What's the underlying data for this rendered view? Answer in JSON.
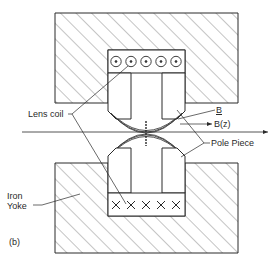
{
  "figure": {
    "panel_label": "(b)",
    "labels": {
      "lens_coil": "Lens coil",
      "b_vector": "B",
      "b_z": "B(z)",
      "pole_piece": "Pole Piece",
      "iron_yoke_line1": "Iron",
      "iron_yoke_line2": "Yoke"
    },
    "coil_top_symbol": "dot-in-circle (current out of page)",
    "coil_bottom_symbol": "cross (current into page)",
    "coil_turns_per_row": 5,
    "colors": {
      "stroke": "#2a2a2a",
      "hatch": "#555555",
      "background": "#ffffff"
    }
  }
}
